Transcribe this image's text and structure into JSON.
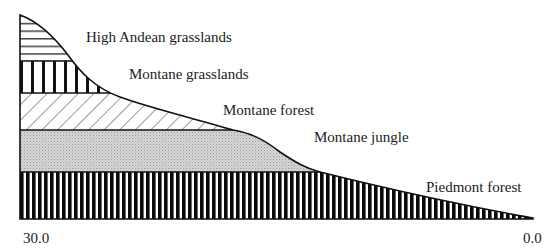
{
  "diagram": {
    "type": "vegetation-zone-profile",
    "zones": [
      {
        "id": "high-andean-grasslands",
        "label": "High Andean grasslands",
        "pattern": "horizontal-stripes"
      },
      {
        "id": "montane-grasslands",
        "label": "Montane grasslands",
        "pattern": "wide-vertical-bars"
      },
      {
        "id": "montane-forest",
        "label": "Montane forest",
        "pattern": "diagonal-hatch"
      },
      {
        "id": "montane-jungle",
        "label": "Montane jungle",
        "pattern": "stipple-gray"
      },
      {
        "id": "piedmont-forest",
        "label": "Piedmont forest",
        "pattern": "dense-vertical-bars"
      }
    ],
    "axis": {
      "left_label": "30.0",
      "right_label": "0.0"
    }
  }
}
